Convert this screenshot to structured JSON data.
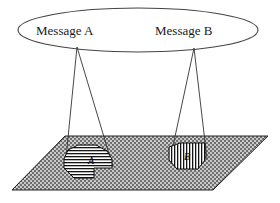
{
  "figure": {
    "background_color": "#ffffff",
    "line_color": "#333333",
    "plane_fill_color": "#9a9a9a",
    "plane_pattern": "checker-dither"
  },
  "ellipse": {
    "name": "message-space-ellipse",
    "cx": 138,
    "cy": 30,
    "rx": 120,
    "ry": 22,
    "stroke": "#444444"
  },
  "messages": [
    {
      "id": "a",
      "label": "Message A",
      "label_x": 36,
      "label_y": 35,
      "apex_x": 77,
      "apex_y": 47,
      "cone_left_x": 65,
      "cone_left_y": 168,
      "cone_right_x": 113,
      "cone_right_y": 167
    },
    {
      "id": "b",
      "label": "Message B",
      "label_x": 155,
      "label_y": 35,
      "apex_x": 194,
      "apex_y": 48,
      "cone_left_x": 170,
      "cone_left_y": 160,
      "cone_right_x": 207,
      "cone_right_y": 159
    }
  ],
  "plane": {
    "name": "ground-plane",
    "points": "65,136 268,136 213,190 12,190",
    "fill": "#9a9a9a",
    "stroke": "#222222"
  },
  "regions": [
    {
      "id": "a",
      "label": "A",
      "label_x": 88,
      "label_y": 164,
      "hatch": "horizontal",
      "points": "64,159 68,150 78,145 96,145 107,151 112,159 112,168 94,168 94,178 74,178 68,172 64,168",
      "fill": "#ffffff",
      "stroke": "#111111"
    },
    {
      "id": "b",
      "label": "B",
      "label_x": 184,
      "label_y": 160,
      "hatch": "vertical",
      "points": "169,160 169,147 180,143 205,143 205,160 198,169 177,169",
      "fill": "#ffffff",
      "stroke": "#111111"
    }
  ]
}
